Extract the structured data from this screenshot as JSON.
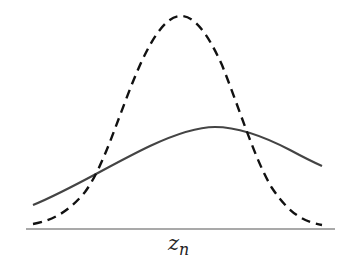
{
  "diagram": {
    "type": "distribution-curves",
    "x_axis_label": "z",
    "x_axis_label_subscript": "n",
    "colors": {
      "solid_curve": "#444444",
      "dashed_curve": "#111111",
      "axis": "#555555",
      "background": "#ffffff"
    },
    "curves": [
      {
        "name": "broad-solid-curve",
        "style": "solid",
        "shape": "gaussian",
        "peak_x_px": 215,
        "peak_y_px": 128,
        "points_px": [
          [
            33,
            205
          ],
          [
            60,
            193
          ],
          [
            92,
            176
          ],
          [
            130,
            155
          ],
          [
            170,
            137
          ],
          [
            215,
            128
          ],
          [
            245,
            132
          ],
          [
            280,
            145
          ],
          [
            322,
            166
          ]
        ]
      },
      {
        "name": "narrow-dashed-curve",
        "style": "dashed",
        "shape": "gaussian",
        "peak_x_px": 181,
        "peak_y_px": 16,
        "points_px": [
          [
            33,
            224
          ],
          [
            60,
            215
          ],
          [
            92,
            176
          ],
          [
            120,
            110
          ],
          [
            150,
            40
          ],
          [
            181,
            16
          ],
          [
            212,
            40
          ],
          [
            245,
            132
          ],
          [
            270,
            185
          ],
          [
            300,
            215
          ],
          [
            322,
            225
          ]
        ]
      }
    ],
    "axis": {
      "x_start_px": 26,
      "x_end_px": 335,
      "y_px": 229
    }
  }
}
